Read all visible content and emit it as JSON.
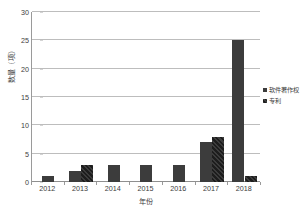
{
  "chart_data": {
    "type": "bar",
    "title": "",
    "xlabel": "年份",
    "ylabel": "数量（项）",
    "categories": [
      "2012",
      "2013",
      "2014",
      "2015",
      "2016",
      "2017",
      "2018"
    ],
    "series": [
      {
        "name": "软件著作权",
        "values": [
          1,
          2,
          3,
          3,
          3,
          7,
          25
        ],
        "color": "#3c3c3c",
        "pattern": "solid"
      },
      {
        "name": "专利",
        "values": [
          0,
          3,
          0,
          0,
          0,
          8,
          1
        ],
        "color": "#3c3c3c",
        "pattern": "diagonal-hatch"
      }
    ],
    "ylim": [
      0,
      30
    ],
    "yticks": [
      0,
      5,
      10,
      15,
      20,
      25,
      30
    ],
    "ytick_labels": [
      "0",
      "5",
      "10",
      "15",
      "20",
      "25",
      "30"
    ],
    "grid": true,
    "grid_axis": "y",
    "legend_position": "right"
  },
  "legend": {
    "entries": [
      {
        "label": "软件著作权"
      },
      {
        "label": "专利"
      }
    ]
  },
  "axes": {
    "y_title": "数量（项）",
    "x_title": "年份"
  }
}
